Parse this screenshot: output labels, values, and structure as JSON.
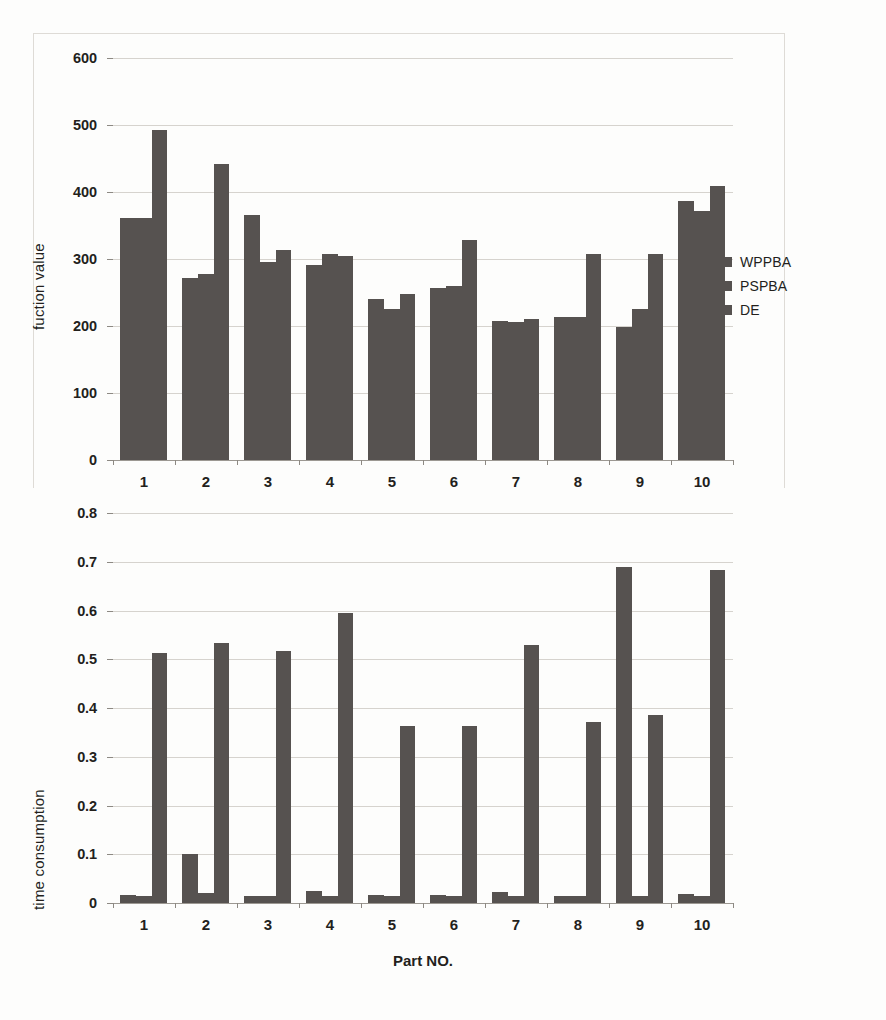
{
  "figure": {
    "series_names": [
      "WPPBA",
      "PSPBA",
      "DE"
    ],
    "bar_color": "#565250",
    "grid_color": "#cfcbc5",
    "text_color": "#231f1c"
  },
  "legend": {
    "items": [
      {
        "label": "WPPBA",
        "color": "#565250"
      },
      {
        "label": "PSPBA",
        "color": "#565250"
      },
      {
        "label": "DE",
        "color": "#565250"
      }
    ]
  },
  "chart_data": [
    {
      "type": "bar",
      "id": "function-value-chart",
      "title": "",
      "xlabel": "",
      "ylabel": "fuction value",
      "categories": [
        "1",
        "2",
        "3",
        "4",
        "5",
        "6",
        "7",
        "8",
        "9",
        "10"
      ],
      "yticks": [
        0,
        100,
        200,
        300,
        400,
        500,
        600
      ],
      "ytick_labels": [
        "0",
        "100",
        "200",
        "300",
        "400",
        "500",
        "600"
      ],
      "ylim": [
        0,
        600
      ],
      "grid": true,
      "legend_position": "right",
      "series": [
        {
          "name": "WPPBA",
          "values": [
            361,
            272,
            366,
            291,
            241,
            257,
            207,
            213,
            198,
            387
          ]
        },
        {
          "name": "PSPBA",
          "values": [
            361,
            277,
            295,
            307,
            226,
            259,
            206,
            213,
            226,
            371
          ]
        },
        {
          "name": "DE",
          "values": [
            493,
            442,
            313,
            304,
            248,
            329,
            211,
            308,
            308,
            409
          ]
        }
      ]
    },
    {
      "type": "bar",
      "id": "time-consumption-chart",
      "title": "",
      "xlabel": "Part NO.",
      "ylabel": "time consumption",
      "categories": [
        "1",
        "2",
        "3",
        "4",
        "5",
        "6",
        "7",
        "8",
        "9",
        "10"
      ],
      "yticks": [
        0,
        0.1,
        0.2,
        0.3,
        0.4,
        0.5,
        0.6,
        0.7,
        0.8
      ],
      "ytick_labels": [
        "0",
        "0.1",
        "0.2",
        "0.3",
        "0.4",
        "0.5",
        "0.6",
        "0.7",
        "0.8"
      ],
      "ylim": [
        0,
        0.8
      ],
      "grid": true,
      "legend_position": "none",
      "series": [
        {
          "name": "WPPBA",
          "values": [
            0.017,
            0.1,
            0.014,
            0.025,
            0.017,
            0.017,
            0.022,
            0.014,
            0.69,
            0.019
          ]
        },
        {
          "name": "PSPBA",
          "values": [
            0.015,
            0.02,
            0.014,
            0.014,
            0.014,
            0.014,
            0.014,
            0.014,
            0.014,
            0.014
          ]
        },
        {
          "name": "DE",
          "values": [
            0.512,
            0.534,
            0.516,
            0.594,
            0.363,
            0.363,
            0.529,
            0.371,
            0.386,
            0.684
          ]
        }
      ]
    }
  ]
}
